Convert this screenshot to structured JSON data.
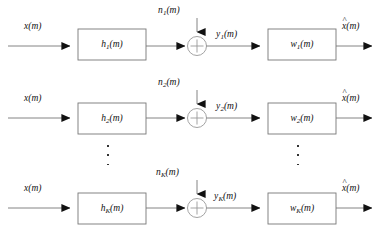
{
  "diagram": {
    "type": "block-diagram",
    "stroke_color": "#555555",
    "box_border_color": "#666666",
    "text_color": "#111111",
    "rows": [
      {
        "id": "channel-1",
        "input_label": "x(m)",
        "filter_label": "h",
        "filter_sub": "1",
        "filter_suffix": "(m)",
        "noise_label": "n",
        "noise_sub": "1",
        "noise_suffix": "(m)",
        "mid_label": "y",
        "mid_sub": "1",
        "mid_suffix": "(m)",
        "equalizer_label": "w",
        "equalizer_sub": "1",
        "equalizer_suffix": "(m)",
        "output_label": "x(m)",
        "output_hat": "^",
        "sum_symbol": "+"
      },
      {
        "id": "channel-2",
        "input_label": "x(m)",
        "filter_label": "h",
        "filter_sub": "2",
        "filter_suffix": "(m)",
        "noise_label": "n",
        "noise_sub": "2",
        "noise_suffix": "(m)",
        "mid_label": "y",
        "mid_sub": "2",
        "mid_suffix": "(m)",
        "equalizer_label": "w",
        "equalizer_sub": "2",
        "equalizer_suffix": "(m)",
        "output_label": "x(m)",
        "output_hat": "^",
        "sum_symbol": "+"
      },
      {
        "id": "channel-K",
        "input_label": "x(m)",
        "filter_label": "h",
        "filter_sub": "K",
        "filter_suffix": "(m)",
        "noise_label": "n",
        "noise_sub": "K",
        "noise_suffix": "(m)",
        "mid_label": "y",
        "mid_sub": "K",
        "mid_suffix": "(m)",
        "equalizer_label": "w",
        "equalizer_sub": "K",
        "equalizer_suffix": "(m)",
        "output_label": "x(m)",
        "output_hat": "^",
        "sum_symbol": "+"
      }
    ],
    "ellipsis": {
      "dot_count": 3,
      "left_column_label": "vertical-ellipsis-filters",
      "right_column_label": "vertical-ellipsis-equalizers"
    }
  }
}
